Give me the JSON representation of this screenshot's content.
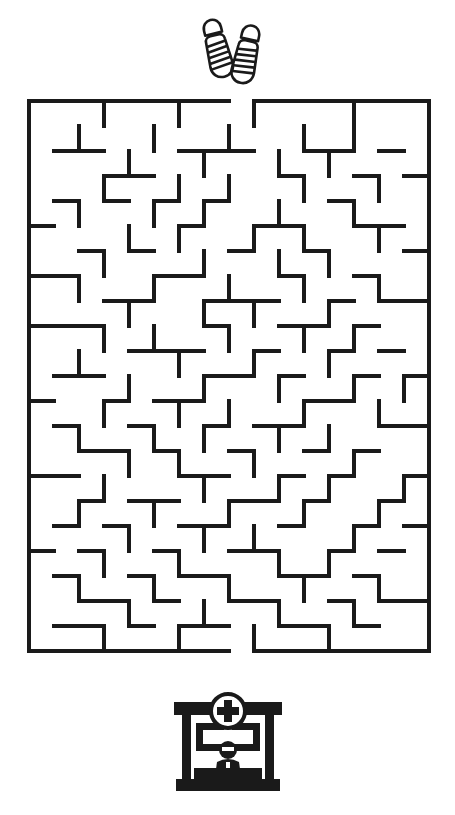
{
  "puzzle": {
    "type": "maze",
    "title": "",
    "background_color": "#ffffff",
    "ink_color": "#1a1a1a"
  },
  "start_marker": {
    "icon_name": "sandals-footwear-icon",
    "label": "",
    "position": "top-center",
    "color": "#1a1a1a"
  },
  "goal_marker": {
    "icon_name": "hospital-reception-desk-icon",
    "label": "",
    "position": "bottom-center",
    "color": "#1a1a1a"
  },
  "maze": {
    "columns": 16,
    "rows": 22,
    "cell_size": 25,
    "wall_thickness": 4,
    "wall_color": "#1a1a1a",
    "entrance": {
      "side": "top",
      "column": 8
    },
    "exit": {
      "side": "bottom",
      "column": 8
    },
    "h_walls": [
      "1111111101111111",
      "0000000000000000",
      "0110001110011010",
      "0001100000100101",
      "0101010100001000",
      "1000001001100110",
      "0010100010010001",
      "1100011000100100",
      "0001100111001011",
      "1110000100110100",
      "0000111001001010",
      "0110000110100101",
      "1001011000011000",
      "0100100101100011",
      "0011010010010100",
      "1100001100101001",
      "0010110011010010",
      "0101001100100101",
      "1010010011001010",
      "0100101100110100",
      "0011010011001011",
      "0110101100110100",
      "1111111101111111"
    ],
    "v_walls": [
      "10010010010001001",
      "10100100100101001",
      "10001001001010001",
      "10010010100100101",
      "10100101001001001",
      "10001010010100101",
      "10010001001010001",
      "10100100100100101",
      "10001001010010001",
      "10010100100101001",
      "10100010010010001",
      "10001001001001011",
      "10010010100100101",
      "10100101001010001",
      "10001010010001001",
      "10010001001010011",
      "10100100100100101",
      "10001001010001001",
      "10010010001010001",
      "10100100100100101",
      "10001001001001001",
      "10010010010010001"
    ]
  }
}
